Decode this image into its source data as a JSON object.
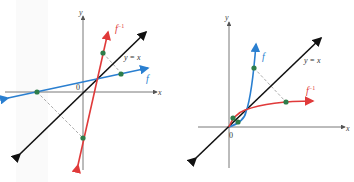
{
  "figures": [
    {
      "id": "left",
      "axis_x_label": "x",
      "axis_y_label": "y",
      "origin_label": "0",
      "line_label": "y = x",
      "f_label": "f",
      "finv_label": "f",
      "finv_sup": "−1",
      "colors": {
        "f": "#2a7fd0",
        "finv": "#e03a3a",
        "identity": "#111111",
        "point": "#2e7d4a",
        "axis": "#555555"
      }
    },
    {
      "id": "right",
      "axis_x_label": "x",
      "axis_y_label": "y",
      "origin_label": "0",
      "line_label": "y = x",
      "f_label": "f",
      "finv_label": "f",
      "finv_sup": "−1",
      "colors": {
        "f": "#2a7fd0",
        "finv": "#e03a3a",
        "identity": "#111111",
        "point": "#2e7d4a",
        "axis": "#555555"
      }
    }
  ]
}
